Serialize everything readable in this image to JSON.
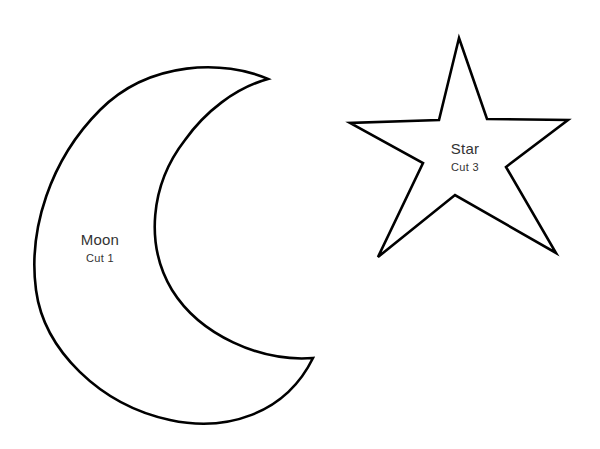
{
  "page": {
    "background": "#ffffff",
    "stroke_color": "#000000",
    "text_color": "#333333"
  },
  "shapes": [
    {
      "id": "moon",
      "type": "crescent-moon-outline",
      "name": "Moon",
      "cut": "Cut 1"
    },
    {
      "id": "star",
      "type": "five-point-star-outline",
      "name": "Star",
      "cut": "Cut 3"
    }
  ]
}
